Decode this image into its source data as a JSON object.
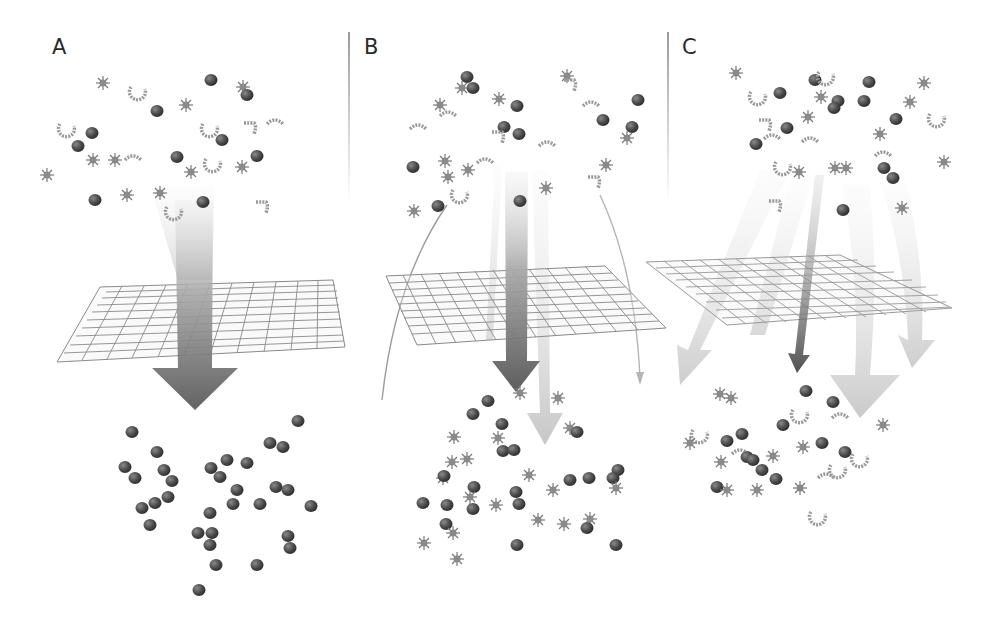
{
  "figure": {
    "panels": [
      {
        "label": "A",
        "description": "Mixed particles above a grid filter; a single broad dark arrow passes through the grid; only compact blob particles end up below",
        "arrows": [
          {
            "type": "main",
            "shade": "dark",
            "width": "broad"
          }
        ],
        "particles_below": [
          "blob"
        ]
      },
      {
        "label": "B",
        "description": "Mixed particles above a grid filter; a main dark arrow and lighter side arrows pass through; blobs and star-shaped particles end up below",
        "arrows": [
          {
            "type": "main",
            "shade": "dark",
            "width": "medium"
          },
          {
            "type": "side",
            "shade": "light",
            "width": "narrow"
          },
          {
            "type": "side",
            "shade": "light",
            "width": "narrow"
          },
          {
            "type": "curved-thin",
            "shade": "light",
            "width": "thin"
          },
          {
            "type": "curved-thin",
            "shade": "light",
            "width": "thin"
          }
        ],
        "particles_below": [
          "blob",
          "star"
        ]
      },
      {
        "label": "C",
        "description": "Mixed particles above a grid filter; multiple broad light arrows fan out through and around the grid plus a thin dark central arrow; blobs, stars and chains all end up below",
        "arrows": [
          {
            "type": "main",
            "shade": "dark",
            "width": "narrow"
          },
          {
            "type": "side",
            "shade": "light",
            "width": "broad"
          },
          {
            "type": "side",
            "shade": "light",
            "width": "broad"
          },
          {
            "type": "side",
            "shade": "light",
            "width": "broad"
          },
          {
            "type": "side",
            "shade": "light",
            "width": "broad"
          }
        ],
        "particles_below": [
          "blob",
          "star",
          "chain"
        ]
      }
    ],
    "legend_shapes": {
      "blob": "dark-sphere",
      "star": "spiky-star",
      "chain": "beaded-chain"
    },
    "colors": {
      "dark_arrow": "#555555",
      "light_arrow": "#bdbdbd",
      "grid": "#8c8c8c",
      "blob": "#4a4a4a",
      "star": "#8a8a8a",
      "chain": "#9a9a9a"
    }
  }
}
